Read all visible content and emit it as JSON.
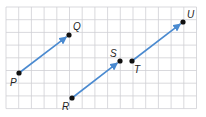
{
  "diagram": {
    "type": "coordinate-grid-vectors",
    "grid": {
      "x0": 6,
      "y0": 7,
      "cell": 12.7,
      "cols": 15,
      "rows": 8,
      "color": "#cfcfd4"
    },
    "vector_color": "#4a8ad0",
    "points": [
      {
        "name": "P",
        "label": "P",
        "x": 19,
        "y": 73,
        "lx": 10,
        "ly": 86
      },
      {
        "name": "Q",
        "label": "Q",
        "x": 69,
        "y": 35,
        "lx": 73,
        "ly": 30
      },
      {
        "name": "R",
        "label": "R",
        "x": 72,
        "y": 98,
        "lx": 62,
        "ly": 110
      },
      {
        "name": "S",
        "label": "S",
        "x": 120,
        "y": 61,
        "lx": 110,
        "ly": 57
      },
      {
        "name": "T",
        "label": "T",
        "x": 132,
        "y": 61,
        "lx": 134,
        "ly": 73
      },
      {
        "name": "U",
        "label": "U",
        "x": 183,
        "y": 22,
        "lx": 187,
        "ly": 18
      }
    ],
    "vectors": [
      {
        "from": "P",
        "to": "Q"
      },
      {
        "from": "R",
        "to": "S"
      },
      {
        "from": "T",
        "to": "U"
      }
    ]
  }
}
